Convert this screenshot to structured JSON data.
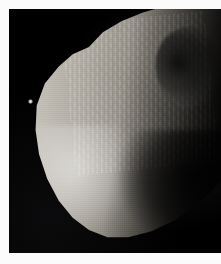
{
  "image": {
    "subject": "Hyperion",
    "subject_type": "moon",
    "caption": "",
    "alt_text": "Heavily cratered sponge-like moon Hyperion against black space",
    "frame": {
      "border_color": "#fbfbfb",
      "sky_color": "#000000",
      "border_left_px": 9,
      "border_top_px": 9,
      "border_bottom_px": 11,
      "border_right_px": 0
    },
    "lighting": {
      "sun_direction": "lower-left",
      "terminator_side": "right"
    },
    "features": [
      {
        "name": "background-star",
        "x_pct": 10,
        "y_pct": 38,
        "brightness": "faint"
      },
      {
        "name": "large-dark-floored-crater",
        "x_pct": 74,
        "y_pct": 26,
        "size": "large"
      },
      {
        "name": "bright-illuminated-flank",
        "x_pct": 26,
        "y_pct": 72,
        "size": "large"
      },
      {
        "name": "shadowed-lower-right-lobe",
        "x_pct": 70,
        "y_pct": 76,
        "size": "large"
      },
      {
        "name": "sponge-crater-field",
        "x_pct": 50,
        "y_pct": 45,
        "size": "full-disk"
      }
    ],
    "palette": {
      "highlight": "#d8d4cc",
      "midtone": "#8d887f",
      "shadow": "#2a2826",
      "black": "#000000",
      "border": "#fbfbfb"
    }
  }
}
